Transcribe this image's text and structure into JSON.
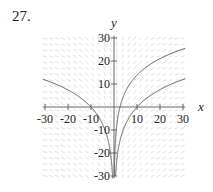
{
  "problem_number": "27.",
  "chart_data": {
    "type": "line",
    "title": "",
    "subtitle": "Slope field with solution curves",
    "xlabel": "x",
    "ylabel": "y",
    "xlim": [
      -31,
      31
    ],
    "ylim": [
      -31,
      31
    ],
    "grid": false,
    "x_ticks": [
      -30,
      -20,
      -10,
      10,
      20,
      30
    ],
    "x_tick_labels": [
      "-30",
      "-20",
      "-10",
      "10",
      "20",
      "30"
    ],
    "y_ticks": [
      -30,
      -20,
      -10,
      10,
      20,
      30
    ],
    "y_tick_labels": [
      "-30",
      "-20",
      "-10",
      "10",
      "20",
      "30"
    ],
    "slope_field": {
      "description": "direction field dy/dx ≈ 10/x",
      "k": 10.5,
      "color": "#d8d8d8"
    },
    "series": [
      {
        "name": "left-curve",
        "formula": "y = 10.7 ln(|x|/10), x<0",
        "x_points": [
          -30,
          -20,
          -10,
          -5,
          -2,
          -1,
          -0.6
        ],
        "y_points": [
          11.7,
          7.4,
          0,
          -7.4,
          -17.2,
          -24.6,
          -30
        ]
      },
      {
        "name": "upper-right-curve",
        "formula": "y = 10.3 ln(x/2.6), x>0",
        "x_points": [
          0.15,
          0.5,
          1,
          2.6,
          5,
          10,
          20,
          30
        ],
        "y_points": [
          -29.4,
          -17,
          -9.8,
          0,
          6.7,
          13.9,
          21,
          25.2
        ]
      },
      {
        "name": "lower-right-curve",
        "formula": "y = 10.9 ln(x/10), x>0",
        "x_points": [
          0.7,
          1,
          2,
          5,
          10,
          20,
          30
        ],
        "y_points": [
          -29,
          -25.1,
          -17.5,
          -7.6,
          0,
          7.6,
          12
        ]
      }
    ],
    "curve_color": "#555555"
  }
}
